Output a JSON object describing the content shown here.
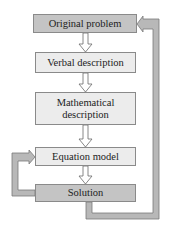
{
  "diagram": {
    "nodes": [
      {
        "id": "original",
        "label": "Original problem",
        "shade": "dark"
      },
      {
        "id": "verbal",
        "label": "Verbal description",
        "shade": "light"
      },
      {
        "id": "math",
        "label": "Mathematical description",
        "line1": "Mathematical",
        "line2": "description",
        "shade": "light"
      },
      {
        "id": "equation",
        "label": "Equation model",
        "shade": "light"
      },
      {
        "id": "solution",
        "label": "Solution",
        "shade": "dark"
      }
    ],
    "edges": [
      {
        "from": "original",
        "to": "verbal"
      },
      {
        "from": "verbal",
        "to": "math"
      },
      {
        "from": "math",
        "to": "equation"
      },
      {
        "from": "equation",
        "to": "solution"
      },
      {
        "from": "solution",
        "to": "equation",
        "type": "loop-left"
      },
      {
        "from": "solution",
        "to": "original",
        "type": "loop-right"
      }
    ],
    "colors": {
      "dark_box": "#c4c4c4",
      "light_box": "#ececec",
      "pipe": "#b8b8b8",
      "outline": "#7a7a7a"
    }
  }
}
